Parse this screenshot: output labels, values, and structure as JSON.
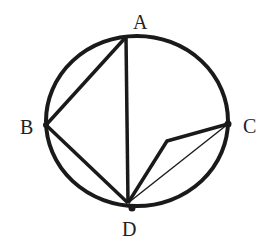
{
  "diagram": {
    "type": "circle-geometry",
    "circle": {
      "cx": 137,
      "cy": 121,
      "rx": 91,
      "ry": 85,
      "stroke": "#1a1a1a",
      "stroke_width": 4
    },
    "points": [
      {
        "id": "A",
        "label": "A",
        "x": 126,
        "y": 37,
        "label_x": 133,
        "label_y": 29
      },
      {
        "id": "B",
        "label": "B",
        "x": 46,
        "y": 125,
        "label_x": 24,
        "label_y": 133
      },
      {
        "id": "C",
        "label": "C",
        "x": 228,
        "y": 124,
        "label_x": 243,
        "label_y": 132
      },
      {
        "id": "D",
        "label": "D",
        "x": 128,
        "y": 203,
        "label_x": 122,
        "label_y": 236
      }
    ],
    "segments": [
      {
        "from": "A",
        "to": "B",
        "weight": "thick"
      },
      {
        "from": "A",
        "to": "D",
        "weight": "thick"
      },
      {
        "from": "B",
        "to": "D",
        "weight": "thick"
      },
      {
        "from": "C",
        "to": "D",
        "weight": "thin"
      },
      {
        "from": "C",
        "to": "P",
        "weight": "thick"
      },
      {
        "from": "P",
        "to": "D",
        "weight": "thick"
      }
    ],
    "bend_point": {
      "id": "P",
      "x": 167,
      "y": 141
    },
    "d_dot": {
      "x": 132,
      "y": 208
    }
  }
}
